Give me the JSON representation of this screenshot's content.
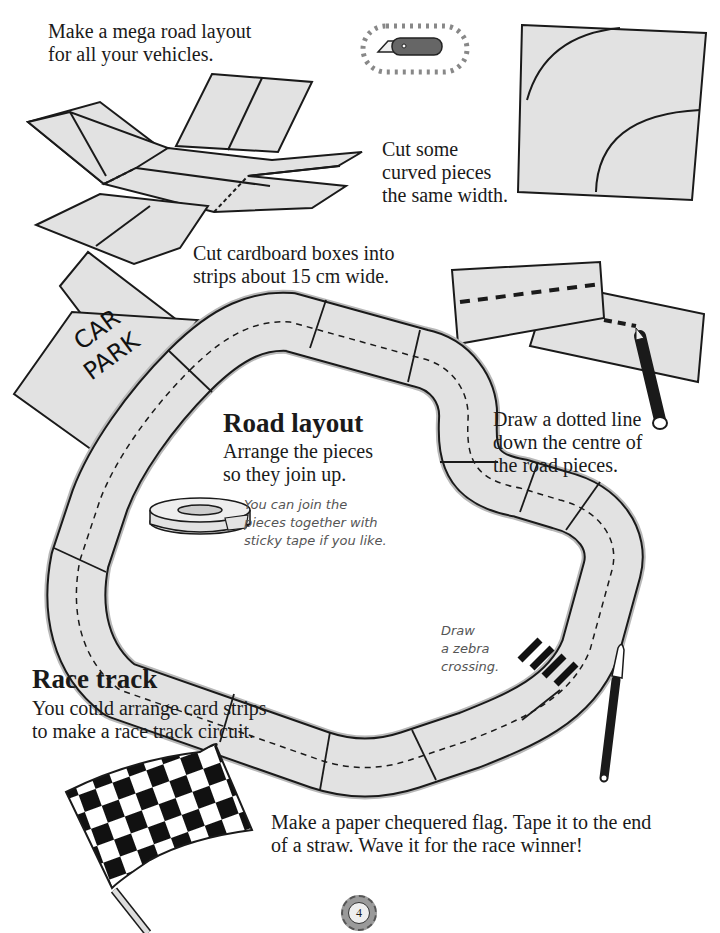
{
  "intro": {
    "text_line1": "Make a mega road layout",
    "text_line2": "for all your vehicles."
  },
  "curved_pieces": {
    "line1": "Cut some",
    "line2": "curved pieces",
    "line3": "the same width."
  },
  "cut_strips": {
    "line1": "Cut cardboard boxes into",
    "line2": "strips about 15 cm wide."
  },
  "dotted_line": {
    "line1": "Draw a dotted line",
    "line2": "down the centre of",
    "line3": "the road pieces."
  },
  "car_park": {
    "line1": "CAR",
    "line2": "PARK"
  },
  "road_layout": {
    "heading": "Road layout",
    "line1": "Arrange the pieces",
    "line2": "so they join up.",
    "tip_line1": "You can join the",
    "tip_line2": "pieces together with",
    "tip_line3": "sticky tape if you like."
  },
  "zebra": {
    "line1": "Draw",
    "line2": "a zebra",
    "line3": "crossing."
  },
  "race_track": {
    "heading": "Race track",
    "line1": "You could arrange card strips",
    "line2": "to make a race track circuit."
  },
  "flag": {
    "line1": "Make a paper chequered flag. Tape it to the end",
    "line2": "of a straw. Wave it for the race winner!"
  },
  "page_number": "4",
  "colors": {
    "card": "#e2e2e2",
    "ink": "#1a1a1a",
    "shadow": "#b8b8b8",
    "note": "#555555"
  }
}
